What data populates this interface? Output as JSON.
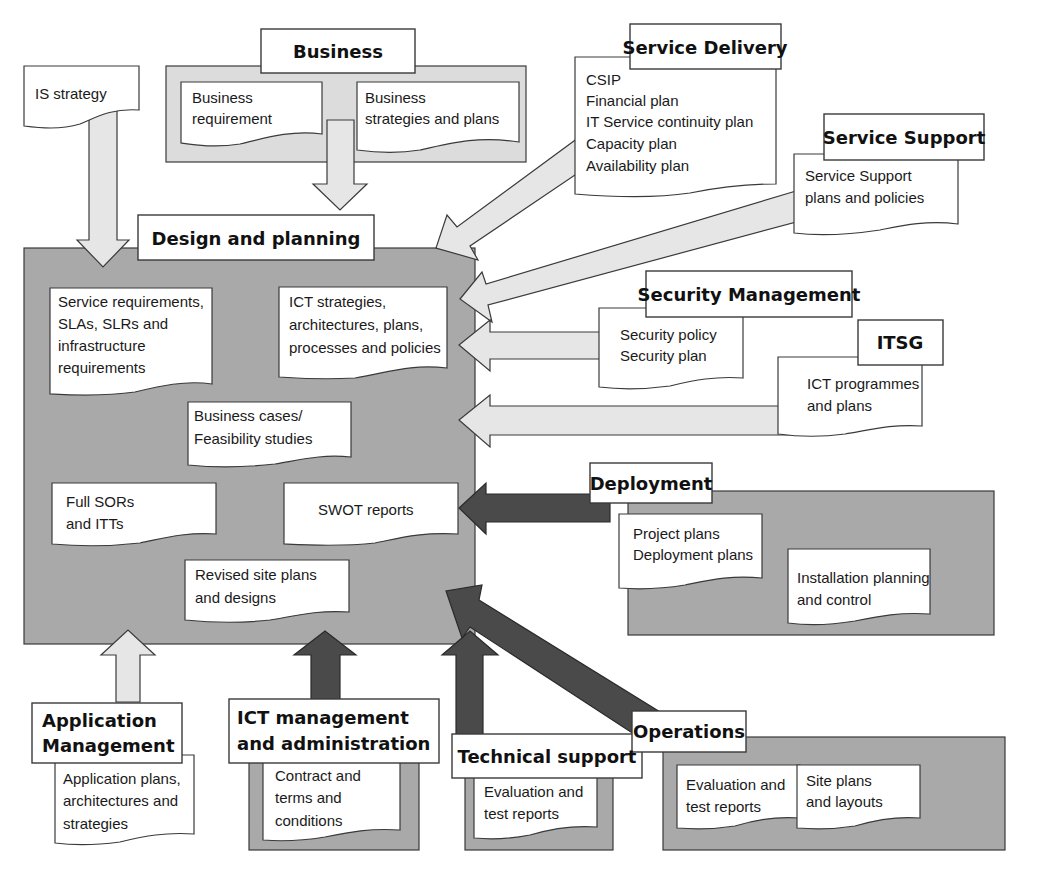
{
  "diagram": {
    "central": {
      "title": "Design and planning",
      "documents": [
        {
          "lines": [
            "Service requirements,",
            "SLAs, SLRs and",
            "infrastructure",
            "requirements"
          ]
        },
        {
          "lines": [
            "ICT strategies,",
            "architectures, plans,",
            "processes and policies"
          ]
        },
        {
          "lines": [
            "Business cases/",
            "Feasibility studies"
          ]
        },
        {
          "lines": [
            "Full SORs",
            "and ITTs"
          ]
        },
        {
          "lines": [
            "SWOT reports"
          ]
        },
        {
          "lines": [
            "Revised site plans",
            "and designs"
          ]
        }
      ]
    },
    "is_strategy": {
      "label": "IS strategy"
    },
    "business": {
      "title": "Business",
      "documents": [
        {
          "lines": [
            "Business",
            "requirement"
          ]
        },
        {
          "lines": [
            "Business",
            "strategies and plans"
          ]
        }
      ]
    },
    "service_delivery": {
      "title": "Service Delivery",
      "lines": [
        "CSIP",
        "Financial plan",
        "IT Service continuity plan",
        "Capacity plan",
        "Availability plan"
      ]
    },
    "service_support": {
      "title": "Service Support",
      "lines": [
        "Service Support",
        "plans and policies"
      ]
    },
    "security_management": {
      "title": "Security Management",
      "lines": [
        "Security policy",
        "Security plan"
      ]
    },
    "itsg": {
      "title": "ITSG",
      "lines": [
        "ICT programmes",
        "and plans"
      ]
    },
    "deployment": {
      "title": "Deployment",
      "documents": [
        {
          "lines": [
            "Project plans",
            "Deployment plans"
          ]
        },
        {
          "lines": [
            "Installation planning",
            "and control"
          ]
        }
      ]
    },
    "application_management": {
      "title_lines": [
        "Application",
        "Management"
      ],
      "lines": [
        "Application plans,",
        "architectures and",
        "strategies"
      ]
    },
    "ict_management": {
      "title_lines": [
        "ICT management",
        "and administration"
      ],
      "lines": [
        "Contract and",
        "terms and",
        "conditions"
      ]
    },
    "technical_support": {
      "title": "Technical support",
      "lines": [
        "Evaluation and",
        "test reports"
      ]
    },
    "operations": {
      "title": "Operations",
      "documents": [
        {
          "lines": [
            "Evaluation and",
            "test reports"
          ]
        },
        {
          "lines": [
            "Site plans",
            "and layouts"
          ]
        }
      ]
    },
    "colors": {
      "panel_dark": "#a9a9a9",
      "panel_light": "#dcdcdc",
      "arrow_light": "#e6e6e6",
      "arrow_dark": "#4a4a4a"
    }
  }
}
